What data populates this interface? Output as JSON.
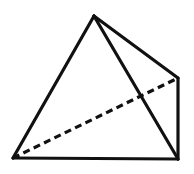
{
  "figure": {
    "background_color": "#ffffff",
    "stroke_color": "#111111",
    "canvas": {
      "width": 194,
      "height": 174
    }
  },
  "chart_data": {
    "type": "diagram",
    "subtype": "wireframe-polyhedron",
    "shape": "tetrahedron",
    "xlabel": "",
    "ylabel": "",
    "xlim": [
      0,
      194
    ],
    "ylim": [
      0,
      174
    ],
    "grid": false,
    "legend": false,
    "vertices": [
      {
        "id": "apex",
        "label": "apex",
        "x": 94,
        "y": 16
      },
      {
        "id": "front-left",
        "label": "front-left base",
        "x": 13,
        "y": 158
      },
      {
        "id": "front-right",
        "label": "front-right base",
        "x": 178,
        "y": 159
      },
      {
        "id": "back-right",
        "label": "back-right base",
        "x": 178,
        "y": 78
      }
    ],
    "edges": [
      {
        "id": "apex-front-left",
        "from": "apex",
        "to": "front-left",
        "style": "solid",
        "hidden": false
      },
      {
        "id": "apex-front-right",
        "from": "apex",
        "to": "front-right",
        "style": "solid",
        "hidden": false
      },
      {
        "id": "apex-back-right",
        "from": "apex",
        "to": "back-right",
        "style": "solid",
        "hidden": false
      },
      {
        "id": "front-left-front-right",
        "from": "front-left",
        "to": "front-right",
        "style": "solid",
        "hidden": false
      },
      {
        "id": "back-right-front-right",
        "from": "back-right",
        "to": "front-right",
        "style": "solid",
        "hidden": false
      },
      {
        "id": "front-left-back-right",
        "from": "front-left",
        "to": "back-right",
        "style": "dashed",
        "hidden": true
      }
    ],
    "stroke_width": 3.2,
    "dash_pattern": "7 4.5",
    "stroke_color": "#111111",
    "fill": "none"
  },
  "geometry": {
    "apex_x": 94,
    "apex_y": 16,
    "front_left_x": 13,
    "front_left_y": 158,
    "front_right_x": 178,
    "front_right_y": 159,
    "back_right_x": 178,
    "back_right_y": 78,
    "stroke_width": "3.2",
    "dash_array": "7 4.5",
    "stroke": "#111111",
    "path_outline": "M 94 16 L 13 158 L 178 159 L 178 78 Z",
    "path_apex_to_front_right": "M 94 16 L 178 159",
    "path_hidden": "M 13 158 L 178 78"
  }
}
